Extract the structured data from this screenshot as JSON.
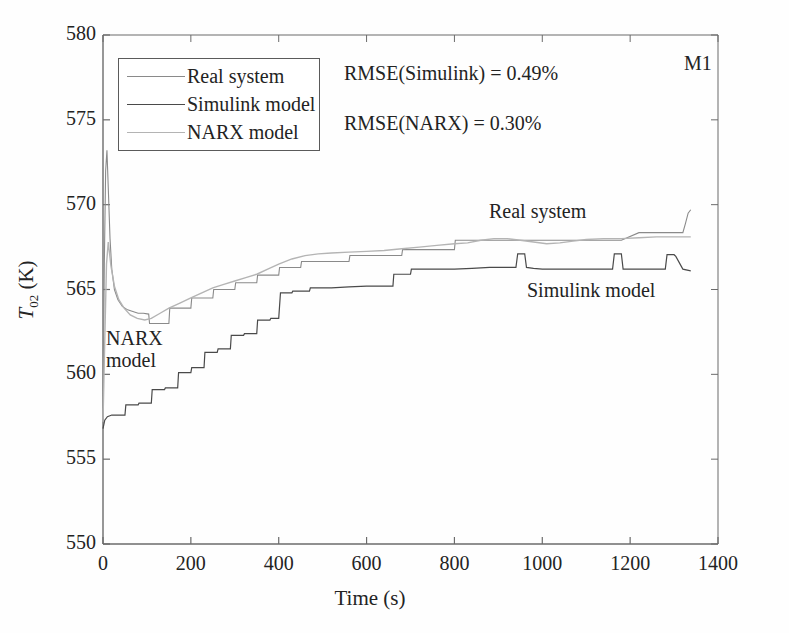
{
  "panel_tag": "M1",
  "annotations": {
    "rmse_simulink": "RMSE(Simulink) = 0.49%",
    "rmse_narx": "RMSE(NARX) = 0.30%",
    "inline_real": "Real system",
    "inline_simulink": "Simulink model",
    "inline_narx": "NARX model"
  },
  "legend": {
    "position": "upper-left-inside",
    "items": [
      {
        "label": "Real system",
        "color": "#8a8a8a"
      },
      {
        "label": "Simulink model",
        "color": "#4a4a4a"
      },
      {
        "label": "NARX model",
        "color": "#b4b4b4"
      }
    ]
  },
  "axes": {
    "xlabel": "Time (s)",
    "ylabel_main": "T",
    "ylabel_sub": "02",
    "ylabel_unit": " (K)",
    "xticks": [
      "0",
      "200",
      "400",
      "600",
      "800",
      "1000",
      "1200",
      "1400"
    ],
    "yticks": [
      "550",
      "555",
      "560",
      "565",
      "570",
      "575",
      "580"
    ]
  },
  "chart_data": {
    "type": "line",
    "title": "",
    "subtitle": "",
    "xlabel": "Time (s)",
    "ylabel": "T_02 (K)",
    "xlim": [
      0,
      1400
    ],
    "ylim": [
      550,
      580
    ],
    "xticks": [
      0,
      200,
      400,
      600,
      800,
      1000,
      1200,
      1400
    ],
    "yticks": [
      550,
      555,
      560,
      565,
      570,
      575,
      580
    ],
    "grid": false,
    "legend_position": "upper left (inside axes)",
    "annotations": [
      {
        "text": "RMSE(Simulink) = 0.49%",
        "x": 560,
        "y": 577.2
      },
      {
        "text": "RMSE(NARX) = 0.30%",
        "x": 560,
        "y": 574.3
      },
      {
        "text": "M1",
        "x": 1350,
        "y": 577.8
      },
      {
        "text": "Real system",
        "x": 880,
        "y": 569.1
      },
      {
        "text": "Simulink model",
        "x": 990,
        "y": 564.5
      },
      {
        "text": "NARX model",
        "x": 120,
        "y": 561.2
      }
    ],
    "series": [
      {
        "name": "Real system",
        "color": "#8a8a8a",
        "style": "solid",
        "width": 1.1,
        "x": [
          0,
          3,
          6,
          9,
          12,
          16,
          20,
          26,
          34,
          44,
          56,
          68,
          80,
          92,
          104,
          106,
          150,
          152,
          200,
          202,
          250,
          252,
          300,
          302,
          350,
          352,
          400,
          402,
          450,
          452,
          500,
          502,
          560,
          562,
          620,
          622,
          680,
          682,
          740,
          742,
          800,
          802,
          860,
          880,
          900,
          940,
          980,
          1020,
          1060,
          1100,
          1140,
          1180,
          1220,
          1260,
          1300,
          1320,
          1326,
          1332,
          1338
        ],
        "y": [
          558.0,
          566.5,
          572.0,
          573.2,
          571.0,
          568.0,
          566.2,
          565.0,
          564.4,
          564.0,
          563.8,
          563.7,
          563.6,
          563.6,
          563.55,
          563.0,
          563.0,
          563.9,
          563.9,
          564.5,
          564.5,
          565.0,
          565.0,
          565.4,
          565.4,
          565.85,
          565.85,
          566.3,
          566.3,
          566.65,
          566.65,
          566.65,
          566.65,
          567.0,
          567.0,
          567.0,
          567.0,
          567.35,
          567.35,
          567.35,
          567.35,
          567.9,
          567.9,
          567.9,
          567.9,
          567.9,
          567.9,
          567.9,
          567.9,
          567.9,
          567.9,
          567.9,
          568.35,
          568.35,
          568.35,
          568.35,
          568.9,
          569.5,
          569.7
        ],
        "description": "Measured data: sharp start-up spike to ~573 K then decay and a rising staircase settling near 568-570 K"
      },
      {
        "name": "Simulink model",
        "color": "#4a4a4a",
        "style": "solid",
        "width": 1.2,
        "x": [
          0,
          4,
          10,
          20,
          30,
          40,
          50,
          52,
          80,
          82,
          110,
          112,
          140,
          142,
          170,
          172,
          200,
          202,
          230,
          232,
          260,
          262,
          290,
          292,
          320,
          322,
          350,
          352,
          380,
          382,
          400,
          404,
          430,
          432,
          470,
          472,
          520,
          560,
          600,
          640,
          660,
          662,
          700,
          702,
          760,
          800,
          840,
          880,
          920,
          940,
          944,
          960,
          964,
          980,
          1000,
          1040,
          1080,
          1120,
          1160,
          1164,
          1180,
          1184,
          1200,
          1240,
          1280,
          1284,
          1300,
          1304,
          1320,
          1338
        ],
        "y": [
          556.8,
          557.3,
          557.5,
          557.6,
          557.6,
          557.6,
          557.6,
          558.2,
          558.2,
          558.3,
          558.3,
          559.1,
          559.1,
          559.2,
          559.2,
          560.1,
          560.1,
          560.4,
          560.4,
          561.3,
          561.3,
          561.5,
          561.5,
          562.3,
          562.3,
          562.4,
          562.4,
          563.2,
          563.2,
          563.3,
          563.3,
          564.8,
          564.8,
          564.9,
          564.9,
          565.1,
          565.1,
          565.15,
          565.2,
          565.2,
          565.2,
          565.9,
          565.9,
          566.2,
          566.2,
          566.2,
          566.25,
          566.3,
          566.3,
          566.3,
          567.1,
          567.1,
          566.3,
          566.25,
          566.2,
          566.2,
          566.2,
          566.2,
          566.2,
          567.1,
          567.1,
          566.2,
          566.2,
          566.2,
          566.2,
          567.05,
          567.05,
          566.95,
          566.2,
          566.1
        ],
        "description": "Simulink physical model: starts low near 557 K, rises in coarse staircase to ~566 K with late square pulses"
      },
      {
        "name": "NARX model",
        "color": "#b4b4b4",
        "style": "solid",
        "width": 1.4,
        "x": [
          0,
          4,
          8,
          12,
          18,
          26,
          36,
          48,
          62,
          78,
          95,
          110,
          130,
          150,
          175,
          200,
          225,
          250,
          275,
          300,
          325,
          350,
          375,
          400,
          430,
          460,
          490,
          520,
          560,
          600,
          640,
          680,
          720,
          760,
          800,
          830,
          860,
          890,
          920,
          950,
          980,
          1010,
          1040,
          1070,
          1100,
          1140,
          1180,
          1220,
          1260,
          1300,
          1338
        ],
        "y": [
          557.2,
          562.0,
          566.5,
          567.8,
          566.4,
          565.2,
          564.4,
          563.9,
          563.5,
          563.3,
          563.2,
          563.3,
          563.6,
          563.9,
          564.2,
          564.5,
          564.8,
          565.1,
          565.3,
          565.5,
          565.7,
          565.9,
          566.2,
          566.5,
          566.8,
          567.0,
          567.1,
          567.15,
          567.2,
          567.25,
          567.3,
          567.4,
          567.5,
          567.6,
          567.7,
          567.75,
          567.9,
          568.0,
          568.0,
          567.9,
          567.8,
          567.7,
          567.75,
          567.85,
          567.95,
          568.0,
          568.0,
          568.05,
          568.1,
          568.1,
          568.1
        ],
        "description": "NARX neural network model: smooth monotonic approach, closely tracking the real system"
      }
    ]
  }
}
